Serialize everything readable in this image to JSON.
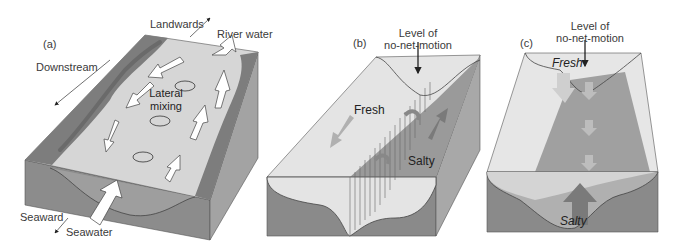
{
  "figure": {
    "panels": [
      {
        "id": "a",
        "label": "(a)",
        "annotations": {
          "landwards": "Landwards",
          "river_water": "River water",
          "downstream": "Downstream",
          "lateral_mixing_line1": "Lateral",
          "lateral_mixing_line2": "mixing",
          "seaward": "Seaward",
          "seawater": "Seawater"
        }
      },
      {
        "id": "b",
        "label": "(b)",
        "annotations": {
          "level_line1": "Level of",
          "level_line2": "no-net-motion",
          "fresh": "Fresh",
          "salty": "Salty"
        }
      },
      {
        "id": "c",
        "label": "(c)",
        "annotations": {
          "level_line1": "Level of",
          "level_line2": "no-net-motion",
          "fresh": "Fresh",
          "salty": "Salty"
        }
      }
    ],
    "colors": {
      "water_surface": "#d9d9d9",
      "block_front": "#8c8c8c",
      "block_side": "#a8a8a8",
      "bank": "#7a7a7a",
      "fresh_light": "#e6e6e6",
      "salty_dark": "#9a9a9a",
      "arrow_fill": "#ffffff",
      "text": "#3a3a3a"
    }
  }
}
